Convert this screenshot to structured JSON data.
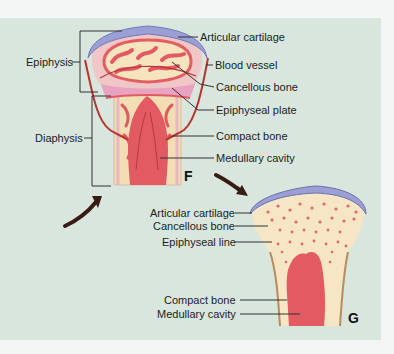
{
  "figure_f": {
    "panel_letter": "F",
    "left_labels": {
      "epiphysis": "Epiphysis",
      "diaphysis": "Diaphysis"
    },
    "right_labels": [
      "Articular cartilage",
      "Blood vessel",
      "Cancellous bone",
      "Epiphyseal plate",
      "Compact bone",
      "Medullary cavity"
    ]
  },
  "figure_g": {
    "panel_letter": "G",
    "labels": [
      "Articular cartilage",
      "Cancellous bone",
      "Epiphyseal line",
      "Compact bone",
      "Medullary cavity"
    ]
  },
  "colors": {
    "panel_background": "#d8e6dd",
    "cartilage": "#9a9fd6",
    "bone": "#f6e4bf",
    "marrow_red": "#e0505a",
    "plate_pink": "#e9a3c0",
    "arrow": "#3a1a14"
  }
}
